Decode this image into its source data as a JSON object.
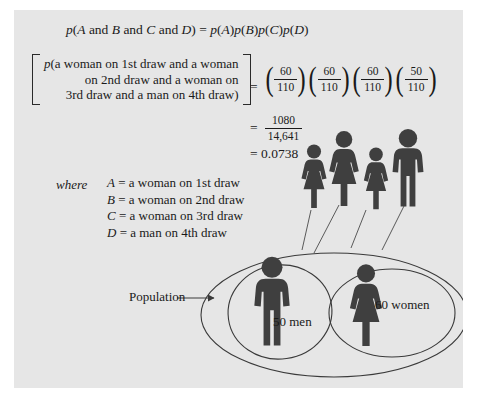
{
  "figure": {
    "background_color": "#e6e6e6",
    "ink_color": "#3a3a3a",
    "equation_main": {
      "lhs_p": "p",
      "lhs_open": "(",
      "lhs_A": "A",
      "and_1": " and ",
      "lhs_B": "B",
      "and_2": " and ",
      "lhs_C": "C",
      "and_3": " and ",
      "lhs_D": "D",
      "lhs_close": ")",
      "equals": " = ",
      "rhs": "p(A)p(B)p(C)p(D)",
      "rhs_p1": "p",
      "rhs_A": "A",
      "rhs_p2": "p",
      "rhs_B": "B",
      "rhs_p3": "p",
      "rhs_C": "C",
      "rhs_p4": "p",
      "rhs_D": "D"
    },
    "probability_statement": {
      "p_symbol": "p",
      "line1": "(a woman on 1st draw and a woman",
      "line2": "on 2nd draw and a woman on",
      "line3": "3rd draw and a man on 4th draw)",
      "equals": "="
    },
    "fractions": [
      {
        "num": "60",
        "den": "110"
      },
      {
        "num": "60",
        "den": "110"
      },
      {
        "num": "60",
        "den": "110"
      },
      {
        "num": "50",
        "den": "110"
      }
    ],
    "result_fraction": {
      "equals": "=",
      "num": "1080",
      "den": "14,641"
    },
    "result_decimal": {
      "equals": "=",
      "value": "0.0738"
    },
    "where_label": "where",
    "definitions": [
      {
        "variable": "A",
        "equals": "=",
        "text": "a woman on 1st draw"
      },
      {
        "variable": "B",
        "equals": "=",
        "text": "a woman on 2nd draw"
      },
      {
        "variable": "C",
        "equals": "=",
        "text": "a woman on 3rd draw"
      },
      {
        "variable": "D",
        "equals": "=",
        "text": "a man on 4th draw"
      }
    ],
    "sample_figures": [
      {
        "type": "woman-icon",
        "label": "woman-1st-draw"
      },
      {
        "type": "woman-icon",
        "label": "woman-2nd-draw"
      },
      {
        "type": "woman-icon",
        "label": "woman-3rd-draw"
      },
      {
        "type": "man-icon",
        "label": "man-4th-draw"
      }
    ],
    "population_label": "Population",
    "men_label": "50 men",
    "women_label": "60 women"
  }
}
